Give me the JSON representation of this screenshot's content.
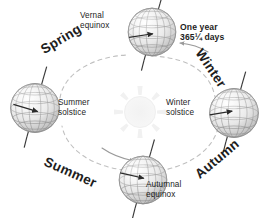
{
  "diagram": {
    "background_color": "#ffffff",
    "text_color": "#1d1d1d",
    "orbit_color": "#b9b9b9",
    "globe_color": "#8e8e8e",
    "sun_color": "#f0f0f0"
  },
  "annotations": {
    "one_year_line1": "One year",
    "one_year_line2": "365¼ days",
    "vernal_equinox_line1": "Vernal",
    "vernal_equinox_line2": "equinox",
    "summer_solstice_line1": "Summer",
    "summer_solstice_line2": "solstice",
    "winter_solstice_line1": "Winter",
    "winter_solstice_line2": "solstice",
    "autumnal_equinox_line1": "Autumnal",
    "autumnal_equinox_line2": "equinox"
  },
  "seasons": {
    "spring": "Spring",
    "winter": "Winter",
    "summer": "Summer",
    "autumn": "Autumn"
  },
  "positions": {
    "sun": {
      "cx": 140,
      "cy": 112,
      "r": 17
    },
    "globes": [
      {
        "name": "vernal-equinox-globe",
        "cx": 152,
        "cy": 32,
        "r": 24
      },
      {
        "name": "winter-solstice-globe",
        "cx": 234,
        "cy": 113,
        "r": 25
      },
      {
        "name": "autumnal-equinox-globe",
        "cx": 143,
        "cy": 180,
        "r": 24
      },
      {
        "name": "summer-solstice-globe",
        "cx": 35,
        "cy": 108,
        "r": 25
      }
    ]
  }
}
